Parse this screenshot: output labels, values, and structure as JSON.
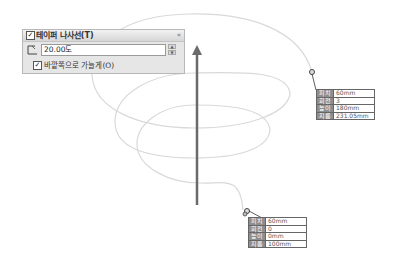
{
  "panel": {
    "title": "테이퍼 나사선(T)",
    "title_checked": "✓",
    "collapse_icon": "«",
    "angle_value": "20.00도",
    "spin_up": "▲",
    "spin_down": "▼",
    "option_checked": "✓",
    "option_label": "바깥쪽으로 가늘게(O)"
  },
  "callouts": {
    "end": {
      "rows": [
        {
          "key": "피치",
          "value": "60mm"
        },
        {
          "key": "회전",
          "value": "3"
        },
        {
          "key": "높이",
          "value": "180mm"
        },
        {
          "key": "지름",
          "value": "231.05mm"
        }
      ]
    },
    "start": {
      "rows": [
        {
          "key": "피치",
          "value": "60mm"
        },
        {
          "key": "회전",
          "value": "0"
        },
        {
          "key": "높이",
          "value": "0mm"
        },
        {
          "key": "지름",
          "value": "100mm"
        }
      ]
    }
  },
  "colors": {
    "spiral": "#d8d8d8",
    "axis": "#6a6a6a",
    "panel_bg": "#e6e6e6"
  }
}
